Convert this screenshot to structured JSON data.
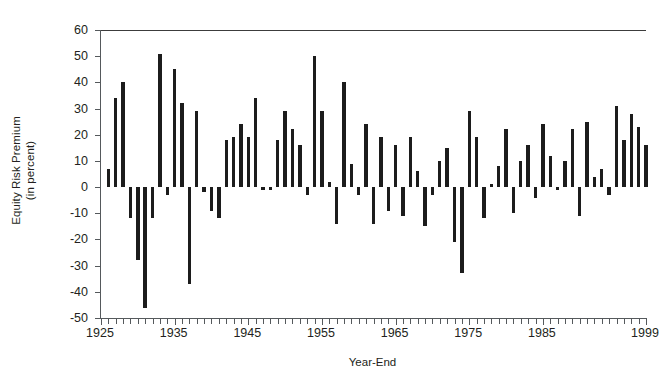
{
  "chart_data": {
    "type": "bar",
    "title": "",
    "xlabel": "Year-End",
    "ylabel": "Equity Risk Premium (in percent)",
    "ylabel_line1": "Equity Risk Premium",
    "ylabel_line2": "(in percent)",
    "ylim": [
      -50,
      60
    ],
    "ytick_values": [
      60,
      50,
      40,
      30,
      20,
      10,
      0,
      -10,
      -20,
      -30,
      -40,
      -50
    ],
    "ytick_labels": [
      "60",
      "50",
      "40",
      "30",
      "20",
      "10",
      "0",
      "-10",
      "-20",
      "-30",
      "-40",
      "-50"
    ],
    "xlim": [
      1925,
      1999
    ],
    "xtick_values": [
      1925,
      1935,
      1945,
      1955,
      1965,
      1975,
      1985,
      1999
    ],
    "xtick_labels": [
      "1925",
      "1935",
      "1945",
      "1955",
      "1965",
      "1975",
      "1985",
      "1999"
    ],
    "grid": false,
    "legend": false,
    "bar_color": "#1c1c1c",
    "axis_color": "#55595c",
    "categories": [
      1926,
      1927,
      1928,
      1929,
      1930,
      1931,
      1932,
      1933,
      1934,
      1935,
      1936,
      1937,
      1938,
      1939,
      1940,
      1941,
      1942,
      1943,
      1944,
      1945,
      1946,
      1947,
      1948,
      1949,
      1950,
      1951,
      1952,
      1953,
      1954,
      1955,
      1956,
      1957,
      1958,
      1959,
      1960,
      1961,
      1962,
      1963,
      1964,
      1965,
      1966,
      1967,
      1968,
      1969,
      1970,
      1971,
      1972,
      1973,
      1974,
      1975,
      1976,
      1977,
      1978,
      1979,
      1980,
      1981,
      1982,
      1983,
      1984,
      1985,
      1986,
      1987,
      1988,
      1989,
      1990,
      1991,
      1992,
      1993,
      1994,
      1995,
      1996,
      1997,
      1998,
      1999
    ],
    "values": [
      7,
      34,
      40,
      -12,
      -28,
      -46,
      -12,
      51,
      -3,
      45,
      32,
      -37,
      29,
      -2,
      -9,
      -12,
      18,
      19,
      24,
      19,
      34,
      -1,
      -1,
      18,
      29,
      22,
      16,
      -3,
      50,
      29,
      2,
      -14,
      40,
      9,
      -3,
      24,
      -14,
      19,
      -9,
      16,
      -11,
      19,
      6,
      -15,
      -3,
      10,
      15,
      -21,
      -33,
      29,
      19,
      -12,
      1,
      8,
      22,
      -10,
      10,
      16,
      -4,
      24,
      12,
      -1,
      10,
      22,
      -11,
      25,
      4,
      7,
      -3,
      31,
      18,
      28,
      23,
      16
    ],
    "series": [
      {
        "name": "Equity Risk Premium",
        "values": [
          7,
          34,
          40,
          -12,
          -28,
          -46,
          -12,
          51,
          -3,
          45,
          32,
          -37,
          29,
          -2,
          -9,
          -12,
          18,
          19,
          24,
          19,
          34,
          -1,
          -1,
          18,
          29,
          22,
          16,
          -3,
          50,
          29,
          2,
          -14,
          40,
          9,
          -3,
          24,
          -14,
          19,
          -9,
          16,
          -11,
          19,
          6,
          -15,
          -3,
          10,
          15,
          -21,
          -33,
          29,
          19,
          -12,
          1,
          8,
          22,
          -10,
          10,
          16,
          -4,
          24,
          12,
          -1,
          10,
          22,
          -11,
          25,
          4,
          7,
          -3,
          31,
          18,
          28,
          23,
          16
        ]
      }
    ]
  }
}
